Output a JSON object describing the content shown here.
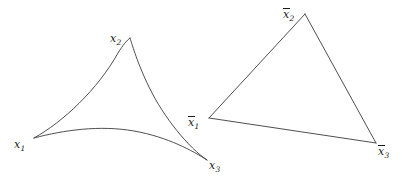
{
  "figure": {
    "caption": "",
    "background_color": "#ffffff",
    "stroke_color": "#3b3b3b",
    "label_color": "#1a1a1a",
    "shapes": [
      {
        "name": "curvilinear-triangle",
        "type": "deltoid",
        "description": "Triangle with three concave (inward-curving) sides meeting at cusps",
        "vertices": [
          {
            "id": "x1",
            "x": 34,
            "y": 138
          },
          {
            "id": "x2",
            "x": 130,
            "y": 38
          },
          {
            "id": "x3",
            "x": 207,
            "y": 160
          }
        ]
      },
      {
        "name": "straight-triangle",
        "type": "triangle",
        "description": "Triangle with three straight sides",
        "vertices": [
          {
            "id": "xbar1",
            "x": 209,
            "y": 118
          },
          {
            "id": "xbar2",
            "x": 305,
            "y": 14
          },
          {
            "id": "xbar3",
            "x": 376,
            "y": 143
          }
        ]
      }
    ],
    "labels": [
      {
        "id": "x1",
        "base": "x",
        "subscript": "1",
        "overbar": false,
        "x": 14,
        "y": 139
      },
      {
        "id": "x2",
        "base": "x",
        "subscript": "2",
        "overbar": false,
        "x": 110,
        "y": 33
      },
      {
        "id": "x3",
        "base": "x",
        "subscript": "3",
        "overbar": false,
        "x": 209,
        "y": 160
      },
      {
        "id": "xbar1",
        "base": "x",
        "subscript": "1",
        "overbar": true,
        "x": 188,
        "y": 117
      },
      {
        "id": "xbar2",
        "base": "x",
        "subscript": "2",
        "overbar": true,
        "x": 283,
        "y": 9
      },
      {
        "id": "xbar3",
        "base": "x",
        "subscript": "3",
        "overbar": true,
        "x": 378,
        "y": 146
      }
    ]
  }
}
